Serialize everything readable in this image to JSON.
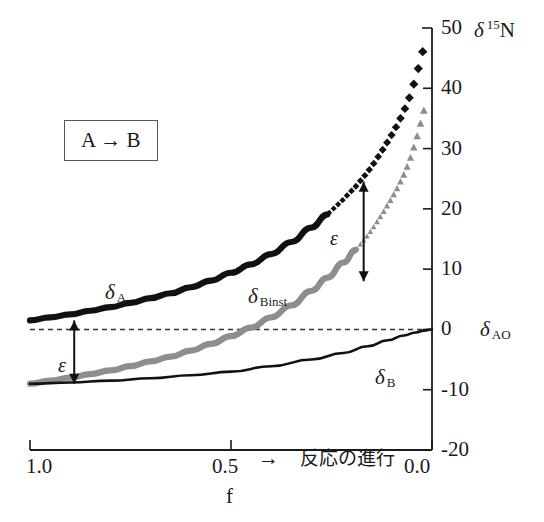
{
  "chart_data": {
    "type": "line",
    "title": "",
    "ylabel": "δ 15N",
    "ylabel_symbol": "δ",
    "ylabel_mass": "15",
    "ylabel_element": "N",
    "xlabel": "f",
    "xaxis_caption_arrow": "→",
    "xaxis_caption": "反応の進行",
    "xlim": [
      1.0,
      0.0
    ],
    "ylim": [
      -20,
      50
    ],
    "xticks": [
      "1.0",
      "0.5",
      "0.0"
    ],
    "xtick_values": [
      1.0,
      0.5,
      0.0
    ],
    "yticks": [
      "50",
      "40",
      "30",
      "20",
      "10",
      "0",
      "-10",
      "-20"
    ],
    "ytick_values": [
      50,
      40,
      30,
      20,
      10,
      0,
      -10,
      -20
    ],
    "grid": false,
    "legend_position": "inline-labels",
    "zero_reference_line": {
      "label": "δ AO",
      "label_symbol": "δ",
      "label_sub": "AO",
      "value": 0,
      "style": "dashed"
    },
    "annotations": [
      {
        "name": "reaction-box",
        "text": "A → B",
        "x": 0.84,
        "y": 33
      },
      {
        "name": "epsilon-left",
        "text": "ε",
        "from_y": 1.5,
        "to_y": -9.0,
        "x": 0.89
      },
      {
        "name": "epsilon-right",
        "text": "ε",
        "from_y": 24.5,
        "to_y": 8.0,
        "x": 0.17
      }
    ],
    "series": [
      {
        "name": "δ A",
        "label_symbol": "δ",
        "label_sub": "A",
        "color": "#111111",
        "style": "thick-solid-then-diamonds",
        "marker": "diamond",
        "x": [
          1.0,
          0.95,
          0.9,
          0.85,
          0.8,
          0.75,
          0.7,
          0.65,
          0.6,
          0.55,
          0.5,
          0.45,
          0.4,
          0.35,
          0.3,
          0.26,
          0.22,
          0.19,
          0.16,
          0.14,
          0.12,
          0.1,
          0.085,
          0.07,
          0.058,
          0.048,
          0.04,
          0.032,
          0.026,
          0.02,
          0.015
        ],
        "values": [
          1.5,
          2.0,
          2.5,
          3.1,
          3.7,
          4.4,
          5.2,
          6.0,
          7.0,
          8.1,
          9.4,
          10.8,
          12.5,
          14.5,
          16.9,
          19.1,
          21.6,
          23.7,
          26.1,
          28.0,
          30.1,
          32.3,
          34.1,
          36.2,
          38.1,
          40.1,
          41.8,
          43.8,
          45.3,
          46.9,
          48.5
        ]
      },
      {
        "name": "δ Binst",
        "label_symbol": "δ",
        "label_sub": "Binst",
        "color": "#8e8e8e",
        "style": "thick-solid-then-triangles",
        "marker": "triangle",
        "x": [
          1.0,
          0.95,
          0.9,
          0.85,
          0.8,
          0.75,
          0.7,
          0.65,
          0.6,
          0.55,
          0.5,
          0.45,
          0.4,
          0.35,
          0.3,
          0.26,
          0.22,
          0.19,
          0.16,
          0.14,
          0.12,
          0.1,
          0.085,
          0.07,
          0.058,
          0.048,
          0.04,
          0.032,
          0.026,
          0.02,
          0.015
        ],
        "values": [
          -9.0,
          -8.5,
          -8.0,
          -7.4,
          -6.8,
          -6.1,
          -5.3,
          -4.5,
          -3.5,
          -2.4,
          -1.1,
          0.3,
          2.0,
          4.0,
          6.4,
          8.6,
          11.1,
          13.2,
          15.6,
          17.5,
          19.6,
          21.8,
          23.6,
          25.7,
          27.6,
          29.6,
          31.3,
          33.3,
          34.8,
          36.4,
          38.0
        ]
      },
      {
        "name": "δ B",
        "label_symbol": "δ",
        "label_sub": "B",
        "color": "#111111",
        "style": "thin-solid",
        "marker": "none",
        "x": [
          1.0,
          0.9,
          0.8,
          0.7,
          0.6,
          0.5,
          0.4,
          0.3,
          0.22,
          0.16,
          0.11,
          0.07,
          0.04,
          0.02,
          0.0
        ],
        "values": [
          -9.0,
          -8.8,
          -8.5,
          -8.1,
          -7.6,
          -7.0,
          -6.1,
          -5.0,
          -3.9,
          -2.8,
          -1.8,
          -1.0,
          -0.5,
          -0.2,
          0.0
        ]
      }
    ],
    "colors": {
      "axis": "#1a1a1a",
      "curve_a": "#111111",
      "curve_binst": "#8e8e8e",
      "curve_b": "#111111",
      "dashed_zero": "#333333",
      "box_border": "#555555",
      "background": "#ffffff"
    }
  },
  "labels": {
    "delta15n": "δ 15N",
    "delta_a": "δ",
    "delta_a_sub": "A",
    "delta_binst": "δ",
    "delta_binst_sub": "Binst",
    "delta_b": "δ",
    "delta_b_sub": "B",
    "delta_ao": "δ",
    "delta_ao_sub": "AO",
    "epsilon": "ε",
    "reaction": "A → B",
    "f_label": "f",
    "progress_arrow": "→",
    "progress_text": "反応の進行",
    "mass_number": "15",
    "element": "N"
  }
}
